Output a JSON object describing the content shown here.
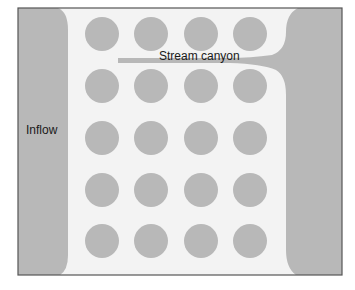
{
  "diagram": {
    "labels": {
      "inflow": "Inflow",
      "stream_canyon": "Stream canyon"
    },
    "colors": {
      "background": "#f3f3f3",
      "gray_fill": "#b8b8b8",
      "frame": "#555555",
      "text": "#1a1a1a"
    },
    "grid": {
      "rows": 5,
      "cols": 4
    }
  }
}
